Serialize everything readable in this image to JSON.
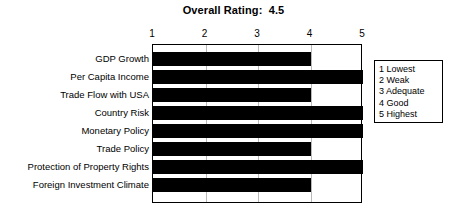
{
  "chart_data": {
    "type": "bar",
    "orientation": "horizontal",
    "title": "Overall Rating:  4.5",
    "xlabel": "",
    "ylabel": "",
    "xlim": [
      1,
      5
    ],
    "xticks": [
      1,
      2,
      3,
      4,
      5
    ],
    "xtick_labels": [
      "1",
      "2",
      "3",
      "4",
      "5"
    ],
    "grid": true,
    "grid_axis": "x",
    "legend_position": "right",
    "bar_color": "#000000",
    "categories": [
      "GDP Growth",
      "Per Capita Income",
      "Trade Flow with USA",
      "Country Risk",
      "Monetary Policy",
      "Trade Policy",
      "Protection of Property Rights",
      "Foreign Investment Climate"
    ],
    "values": [
      4,
      5,
      4,
      5,
      5,
      4,
      5,
      4
    ],
    "legend_entries": [
      "1 Lowest",
      "2 Weak",
      "3 Adequate",
      "4 Good",
      "5 Highest"
    ]
  },
  "overall_rating": "4.5"
}
